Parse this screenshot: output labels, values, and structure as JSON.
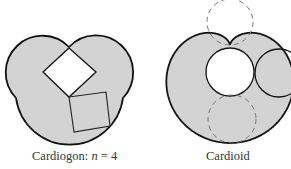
{
  "figure": {
    "colors": {
      "fill": "#d3d3d3",
      "stroke": "#111111",
      "hole": "#ffffff",
      "dash": "#777777"
    },
    "panels": [
      {
        "id": "cardiogon",
        "caption_prefix": "Cardiogon: ",
        "caption_var": "n",
        "caption_suffix": " = 4"
      },
      {
        "id": "cardioid",
        "caption": "Cardioid"
      }
    ]
  }
}
